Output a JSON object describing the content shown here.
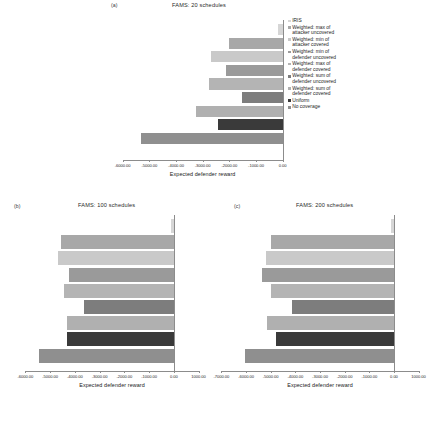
{
  "figure": {
    "xlabel": "Expected defender reward",
    "series_order": [
      "IRIS",
      "Weighted: max of attacker uncovered",
      "Weighted: min of attacker covered",
      "Weighted: min of defender uncovered",
      "Weighted: max of defender covered",
      "Weighted: sum of defender uncovered",
      "Weighted: sum of defender covered",
      "Uniform",
      "No coverage"
    ]
  },
  "legend": {
    "items": [
      {
        "label": "IRIS",
        "color": "#d6d6d6"
      },
      {
        "label": "Weighted: max of\nattacker uncovered",
        "color": "#a8a8a8"
      },
      {
        "label": "Weighted: min of\nattacker covered",
        "color": "#c9c9c9"
      },
      {
        "label": "Weighted: min of\ndefender uncovered",
        "color": "#9a9a9a"
      },
      {
        "label": "Weighted: max of\ndefender covered",
        "color": "#b4b4b4"
      },
      {
        "label": "Weighted: sum of\ndefender uncovered",
        "color": "#7d7d7d"
      },
      {
        "label": "Weighted: sum of\ndefender covered",
        "color": "#b0b0b0"
      },
      {
        "label": "Uniform",
        "color": "#3a3a3a"
      },
      {
        "label": "No coverage",
        "color": "#8f8f8f"
      }
    ]
  },
  "panels": {
    "a": {
      "letter": "(a)",
      "title": "FAMS: 20 schedules"
    },
    "b": {
      "letter": "(b)",
      "title": "FAMS: 100 schedules"
    },
    "c": {
      "letter": "(c)",
      "title": "FAMS: 200 schedules"
    }
  },
  "chart_data": [
    {
      "type": "bar",
      "orientation": "horizontal",
      "title": "FAMS: 20 schedules",
      "panel": "(a)",
      "xlabel": "Expected defender reward",
      "ylabel": "",
      "xlim": [
        -6400,
        200
      ],
      "xticks": [
        -6000,
        -5000,
        -4000,
        -3000,
        -2000,
        -1000,
        0
      ],
      "xticklabels": [
        "-6000.00",
        "-5000.00",
        "-4000.00",
        "-3000.00",
        "-2000.00",
        "-1000.00",
        "0.00"
      ],
      "grid": false,
      "legend_position": "right",
      "categories": [
        "IRIS",
        "Weighted: max of attacker uncovered",
        "Weighted: min of attacker covered",
        "Weighted: min of defender uncovered",
        "Weighted: max of defender covered",
        "Weighted: sum of defender uncovered",
        "Weighted: sum of defender covered",
        "Uniform",
        "No coverage"
      ],
      "values": [
        -180,
        -2030,
        -2700,
        -2130,
        -2760,
        -1530,
        -3250,
        -2430,
        -5330
      ]
    },
    {
      "type": "bar",
      "orientation": "horizontal",
      "title": "FAMS: 100 schedules",
      "panel": "(b)",
      "xlabel": "Expected defender reward",
      "ylabel": "",
      "xlim": [
        -6300,
        1300
      ],
      "xticks": [
        -6000,
        -5000,
        -4000,
        -3000,
        -2000,
        -1000,
        0,
        1000
      ],
      "xticklabels": [
        "-6000.00",
        "-5000.00",
        "-4000.00",
        "-3000.00",
        "-2000.00",
        "-1000.00",
        "0.00",
        "1000.00"
      ],
      "grid": false,
      "legend_position": "none",
      "categories": [
        "IRIS",
        "Weighted: max of attacker uncovered",
        "Weighted: min of attacker covered",
        "Weighted: min of defender uncovered",
        "Weighted: max of defender covered",
        "Weighted: sum of defender uncovered",
        "Weighted: sum of defender covered",
        "Uniform",
        "No coverage"
      ],
      "values": [
        -120,
        -4550,
        -4700,
        -4250,
        -4450,
        -3650,
        -4300,
        -4300,
        -5450
      ]
    },
    {
      "type": "bar",
      "orientation": "horizontal",
      "title": "FAMS: 200 schedules",
      "panel": "(c)",
      "xlabel": "Expected defender reward",
      "ylabel": "",
      "xlim": [
        -7300,
        1300
      ],
      "xticks": [
        -7000,
        -6000,
        -5000,
        -4000,
        -3000,
        -2000,
        -1000,
        0,
        1000
      ],
      "xticklabels": [
        "-7000.00",
        "-6000.00",
        "-5000.00",
        "-4000.00",
        "-3000.00",
        "-2000.00",
        "-1000.00",
        "0.00",
        "1000.00"
      ],
      "grid": false,
      "legend_position": "none",
      "categories": [
        "IRIS",
        "Weighted: max of attacker uncovered",
        "Weighted: min of attacker covered",
        "Weighted: min of defender uncovered",
        "Weighted: max of defender covered",
        "Weighted: sum of defender uncovered",
        "Weighted: sum of defender covered",
        "Uniform",
        "No coverage"
      ],
      "values": [
        -130,
        -5000,
        -5200,
        -5350,
        -5000,
        -4150,
        -5150,
        -4800,
        -6050
      ]
    }
  ]
}
